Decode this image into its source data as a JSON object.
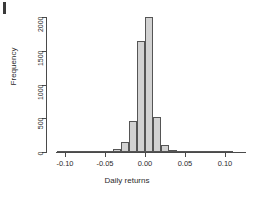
{
  "figure": {
    "background": "#ffffff",
    "artifact": {
      "present": true,
      "name": "corner-mark"
    }
  },
  "chart_data": {
    "type": "bar",
    "subtype": "histogram",
    "title": "",
    "xlabel": "Daily returns",
    "ylabel": "Frequency",
    "xlim": [
      -0.115,
      0.115
    ],
    "ylim": [
      0,
      2000
    ],
    "grid": false,
    "legend": null,
    "bin_width": 0.01,
    "bar_fill": "#d2d2d2",
    "bar_edge": "#555555",
    "xticks": [
      -0.1,
      -0.05,
      0.0,
      0.05,
      0.1
    ],
    "xtick_labels": [
      "-0.10",
      "-0.05",
      "0.00",
      "0.05",
      "0.10"
    ],
    "yticks": [
      0,
      500,
      1000,
      1500,
      2000
    ],
    "ytick_labels": [
      "0",
      "500",
      "1000",
      "1500",
      "2000"
    ],
    "bin_edges": [
      -0.11,
      -0.1,
      -0.09,
      -0.08,
      -0.07,
      -0.06,
      -0.05,
      -0.04,
      -0.03,
      -0.02,
      -0.01,
      0.0,
      0.01,
      0.02,
      0.03,
      0.04,
      0.05,
      0.06,
      0.07,
      0.08,
      0.09,
      0.1,
      0.11
    ],
    "categories": [
      "-0.11",
      "-0.10",
      "-0.09",
      "-0.08",
      "-0.07",
      "-0.06",
      "-0.05",
      "-0.04",
      "-0.03",
      "-0.02",
      "-0.01",
      "0.00",
      "0.01",
      "0.02",
      "0.03",
      "0.04",
      "0.05",
      "0.06",
      "0.07",
      "0.08",
      "0.09",
      "0.10"
    ],
    "values": [
      2,
      3,
      3,
      4,
      6,
      10,
      18,
      40,
      150,
      460,
      1650,
      2000,
      520,
      100,
      35,
      18,
      10,
      6,
      4,
      3,
      2,
      2
    ]
  }
}
